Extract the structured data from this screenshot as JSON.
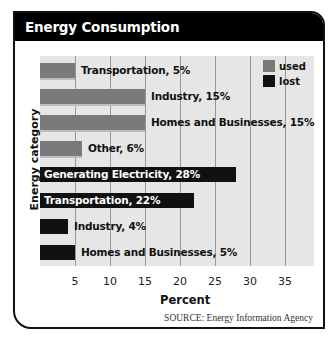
{
  "title": "Energy Consumption",
  "source": "SOURCE: Energy Information Agency",
  "colors": {
    "used": "#7a7a7a",
    "lost": "#111111",
    "title_bg": "#000000",
    "plot_bg": "#e6e6e6"
  },
  "legend": [
    {
      "label": "used",
      "color": "#7a7a7a"
    },
    {
      "label": "lost",
      "color": "#111111"
    }
  ],
  "chart_data": {
    "type": "bar",
    "orientation": "horizontal",
    "title": "Energy Consumption",
    "xlabel": "Percent",
    "ylabel": "Energy category",
    "xlim": [
      0,
      37
    ],
    "xticks": [
      5,
      10,
      15,
      20,
      25,
      30,
      35
    ],
    "grid": true,
    "legend_position": "top-right",
    "categories": [
      "Transportation",
      "Industry",
      "Homes and Businesses",
      "Other",
      "Generating Electricity",
      "Transportation",
      "Industry",
      "Homes and Businesses"
    ],
    "bars": [
      {
        "category": "Transportation",
        "series": "used",
        "value": 5,
        "label": "Transportation, 5%"
      },
      {
        "category": "Industry",
        "series": "used",
        "value": 15,
        "label": "Industry, 15%"
      },
      {
        "category": "Homes and Businesses",
        "series": "used",
        "value": 15,
        "label": "Homes and Businesses, 15%"
      },
      {
        "category": "Other",
        "series": "used",
        "value": 6,
        "label": "Other, 6%"
      },
      {
        "category": "Generating Electricity",
        "series": "lost",
        "value": 28,
        "label": "Generating Electricity, 28%"
      },
      {
        "category": "Transportation",
        "series": "lost",
        "value": 22,
        "label": "Transportation, 22%"
      },
      {
        "category": "Industry",
        "series": "lost",
        "value": 4,
        "label": "Industry, 4%"
      },
      {
        "category": "Homes and Businesses",
        "series": "lost",
        "value": 5,
        "label": "Homes and Businesses, 5%"
      }
    ],
    "series": [
      {
        "name": "used",
        "values": [
          5,
          15,
          15,
          6,
          null,
          null,
          null,
          null
        ]
      },
      {
        "name": "lost",
        "values": [
          null,
          null,
          null,
          null,
          28,
          22,
          4,
          5
        ]
      }
    ],
    "source": "SOURCE: Energy Information Agency"
  }
}
